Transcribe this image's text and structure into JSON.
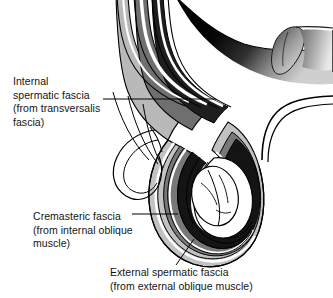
{
  "figure": {
    "background_color": "#ffffff",
    "line_color": "#000000",
    "labels": [
      {
        "id": "internal-spermatic-fascia",
        "line1": "Internal",
        "line2": "spermatic fascia",
        "line3": "(from transversalis",
        "line4": "fascia)"
      },
      {
        "id": "cremasteric-fascia",
        "line1": "Cremasteric fascia",
        "line2": "(from internal oblique",
        "line3": "muscle)",
        "line4": ""
      },
      {
        "id": "external-spermatic-fascia",
        "line1": "External spermatic fascia",
        "line2": "(from external oblique muscle)",
        "line3": "",
        "line4": ""
      }
    ],
    "layer_shades": {
      "dark_band": "#1a1a1a",
      "mid_band": "#6e6e6e",
      "light_band": "#b4b4b4",
      "highlight_band": "#ffffff",
      "cord_shadow": "#0d0d0d",
      "cord_highlight": "#d8d8d8"
    }
  }
}
